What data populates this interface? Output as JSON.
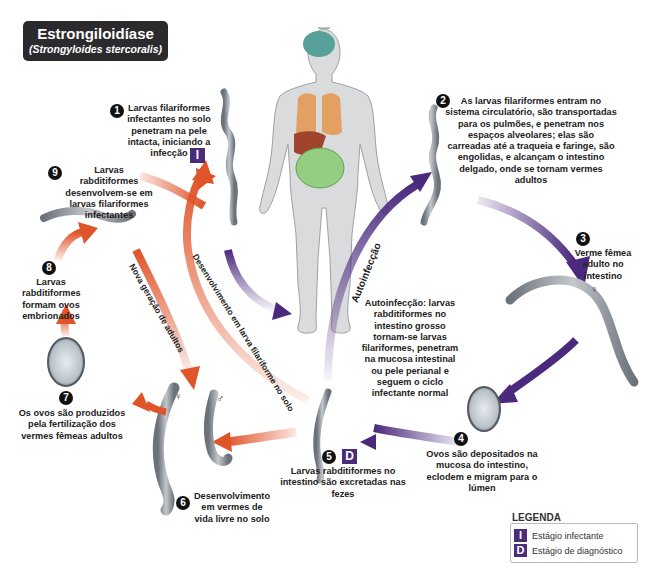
{
  "title": {
    "main": "Estrongiloidíase",
    "species": "(Strongyloides stercoralis)"
  },
  "steps": [
    {
      "number": "1",
      "text": "Larvas filariformes infectantes no solo penetram na pele intacta, iniciando a infecção",
      "badge": "I"
    },
    {
      "number": "2",
      "text": "As larvas filariformes entram no sistema circulatório, são transportadas para os pulmões, e penetram nos espaços alveolares; elas são carreadas até a traqueia e faringe, são engolidas, e alcançam o intestino delgado, onde se tornam vermes adultos"
    },
    {
      "number": "3",
      "text": "Verme fêmea adulto no intestino",
      "symbol": "♀"
    },
    {
      "number": "4",
      "text": "Ovos são depositados na mucosa do intestino, eclodem e migram para o lúmen"
    },
    {
      "number": "5",
      "text": "Larvas rabditiformes no intestino são excretadas nas fezes",
      "badge": "D"
    },
    {
      "number": "6",
      "text": "Desenvolvimento em vermes de vida livre no solo"
    },
    {
      "number": "7",
      "text": "Os ovos são produzidos pela fertilização dos vermes fêmeas adultos"
    },
    {
      "number": "8",
      "text": "Larvas rabditiformes formam ovos embrionados"
    },
    {
      "number": "9",
      "text": "Larvas rabditiformes desenvolvem-se em larvas filariformes infectantes"
    }
  ],
  "autoinfection": {
    "arrow_label": "Autoinfecção",
    "text": "Autoinfecção: larvas rabditiformes no intestino grosso tornam-se larvas filariformes, penetram na mucosa intestinal ou pele perianal e seguem o ciclo infectante normal"
  },
  "arrow_labels": {
    "new_generation": "Nova geração de adultos",
    "soil_development": "Desenvolvimento em larva filariforme no solo"
  },
  "sex_symbols": {
    "female": "♀",
    "male": "♂"
  },
  "legend": {
    "title": "LEGENDA",
    "items": [
      {
        "badge": "I",
        "label": "Estágio infectante"
      },
      {
        "badge": "D",
        "label": "Estágio de diagnóstico"
      }
    ]
  },
  "colors": {
    "title_bg": "#2b2b2d",
    "badge_purple": "#4a2c7a",
    "arrow_purple": "#4b2a7e",
    "arrow_orange": "#e0542a",
    "worm_gray": "#8a8f96"
  }
}
